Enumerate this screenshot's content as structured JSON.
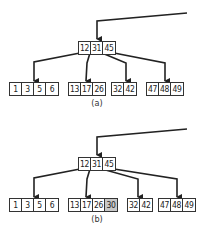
{
  "diagrams": [
    {
      "id": "a",
      "caption": "(a)",
      "root": {
        "keys": [
          "12",
          "31",
          "45"
        ]
      },
      "leaves": [
        {
          "keys": [
            "1",
            "3",
            "5",
            "6"
          ],
          "highlight": []
        },
        {
          "keys": [
            "13",
            "17",
            "26"
          ],
          "highlight": []
        },
        {
          "keys": [
            "32",
            "42"
          ],
          "highlight": []
        },
        {
          "keys": [
            "47",
            "48",
            "49"
          ],
          "highlight": []
        }
      ]
    },
    {
      "id": "b",
      "caption": "(b)",
      "root": {
        "keys": [
          "12",
          "31",
          "45"
        ]
      },
      "leaves": [
        {
          "keys": [
            "1",
            "3",
            "5",
            "6"
          ],
          "highlight": []
        },
        {
          "keys": [
            "13",
            "17",
            "26",
            "30"
          ],
          "highlight": [
            "30"
          ]
        },
        {
          "keys": [
            "32",
            "42"
          ],
          "highlight": []
        },
        {
          "keys": [
            "47",
            "48",
            "49"
          ],
          "highlight": []
        }
      ]
    }
  ],
  "colors": {
    "line": "#222222",
    "border": "#333333",
    "highlight": "#c8c8c8",
    "background": "#ffffff"
  }
}
